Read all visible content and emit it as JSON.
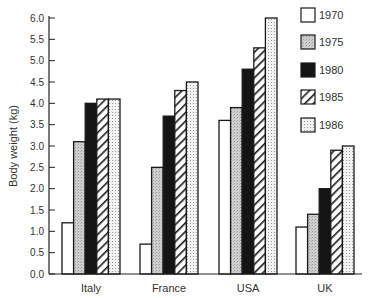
{
  "chart_data": {
    "type": "bar",
    "title": "",
    "xlabel": "",
    "ylabel": "Body weight (kg)",
    "ylim": [
      0,
      6.0
    ],
    "yticks": [
      "0.0",
      "0.5",
      "1.0",
      "1.5",
      "2.0",
      "2.5",
      "3.0",
      "3.5",
      "4.0",
      "4.5",
      "5.0",
      "5.5",
      "6.0"
    ],
    "grid": false,
    "legend_position": "top-right",
    "categories": [
      "Italy",
      "France",
      "USA",
      "UK"
    ],
    "series": [
      {
        "name": "1970",
        "pattern": "white",
        "values": [
          1.2,
          0.7,
          3.6,
          1.1
        ]
      },
      {
        "name": "1975",
        "pattern": "light-gray-stipple",
        "values": [
          3.1,
          2.5,
          3.9,
          1.4
        ]
      },
      {
        "name": "1980",
        "pattern": "black",
        "values": [
          4.0,
          3.7,
          4.8,
          2.0
        ]
      },
      {
        "name": "1985",
        "pattern": "diagonal-hatch",
        "values": [
          4.1,
          4.3,
          5.3,
          2.9
        ]
      },
      {
        "name": "1986",
        "pattern": "fine-dots",
        "values": [
          4.1,
          4.5,
          6.0,
          3.0
        ]
      }
    ]
  },
  "colors": {
    "axis": "#222222",
    "bar_outline": "#1a1a1a",
    "fill_1970": "#ffffff",
    "fill_1975": "#c8c8c8",
    "fill_1980": "#141414",
    "fill_1986": "#e6e6e6"
  }
}
